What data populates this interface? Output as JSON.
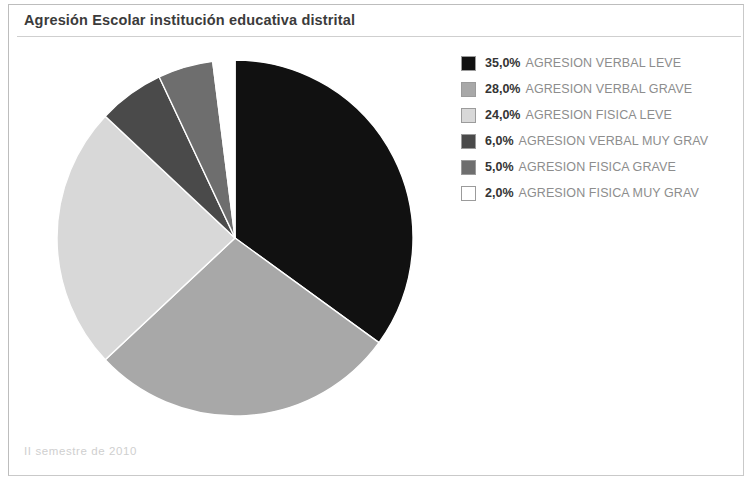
{
  "panel": {
    "title": "Agresión Escolar institución educativa distrital",
    "footer_note": "II semestre de 2010"
  },
  "legend": {
    "items": [
      {
        "pct": "35,0%",
        "label": "AGRESION VERBAL LEVE",
        "color": "#111111"
      },
      {
        "pct": "28,0%",
        "label": "AGRESION VERBAL GRAVE",
        "color": "#a8a8a8"
      },
      {
        "pct": "24,0%",
        "label": "AGRESION FISICA LEVE",
        "color": "#d8d8d8"
      },
      {
        "pct": "6,0%",
        "label": "AGRESION VERBAL MUY GRAV",
        "color": "#4a4a4a"
      },
      {
        "pct": "5,0%",
        "label": "AGRESION FISICA GRAVE",
        "color": "#6e6e6e"
      },
      {
        "pct": "2,0%",
        "label": "AGRESION FISICA MUY GRAV",
        "color": "#ffffff"
      }
    ]
  },
  "chart_data": {
    "type": "pie",
    "title": "Agresión Escolar institución educativa distrital",
    "subtitle": "II semestre de 2010",
    "labels": [
      "AGRESION VERBAL LEVE",
      "AGRESION VERBAL GRAVE",
      "AGRESION FISICA LEVE",
      "AGRESION VERBAL MUY GRAV",
      "AGRESION FISICA GRAVE",
      "AGRESION FISICA MUY GRAV"
    ],
    "values": [
      35.0,
      28.0,
      24.0,
      6.0,
      5.0,
      2.0
    ],
    "value_labels": [
      "35,0%",
      "28,0%",
      "24,0%",
      "6,0%",
      "5,0%",
      "2,0%"
    ],
    "colors": [
      "#111111",
      "#a8a8a8",
      "#d8d8d8",
      "#4a4a4a",
      "#6e6e6e",
      "#ffffff"
    ],
    "unit": "%",
    "total": 100.0,
    "start_angle_deg": 0,
    "direction": "clockwise",
    "legend_position": "right",
    "slice_border_color": "#ffffff"
  }
}
